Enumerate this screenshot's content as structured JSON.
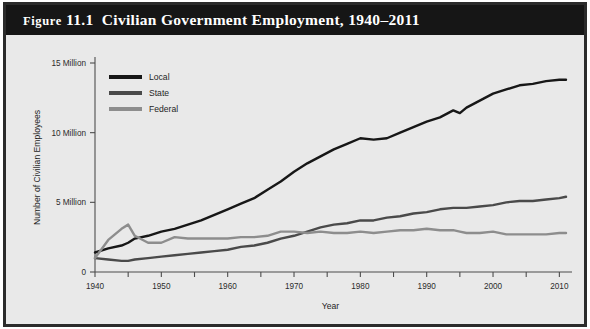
{
  "figure": {
    "label": "Figure",
    "number": "11.1",
    "title": "Civilian Government Employment, 1940–2011",
    "full_title": "Figure 11.1  Civilian Government Employment, 1940–2011"
  },
  "colors": {
    "title_band": "#161616",
    "plot_background": "#e9e9e9",
    "frame": "#2b2b2b",
    "axis": "#4d4d4d",
    "local": "#171717",
    "state": "#4a4a4a",
    "federal": "#8d8d8d"
  },
  "legend": {
    "position": "top-left",
    "items": [
      {
        "label": "Local",
        "color": "#171717",
        "width": 2.6
      },
      {
        "label": "State",
        "color": "#4a4a4a",
        "width": 2.6
      },
      {
        "label": "Federal",
        "color": "#8d8d8d",
        "width": 2.6
      }
    ]
  },
  "chart_data": {
    "type": "line",
    "title": "Civilian Government Employment, 1940–2011",
    "xlabel": "Year",
    "ylabel": "Number of Civilian Employees",
    "xlim": [
      1940,
      2011
    ],
    "ylim": [
      0,
      15
    ],
    "grid": false,
    "units": "millions of employees",
    "legend_position": "top-left",
    "xticks": [
      1940,
      1945,
      1950,
      1955,
      1960,
      1965,
      1970,
      1975,
      1980,
      1985,
      1990,
      1995,
      2000,
      2005,
      2010
    ],
    "xtick_labels": [
      "1940",
      "",
      "1950",
      "",
      "1960",
      "",
      "1970",
      "",
      "1980",
      "",
      "1990",
      "",
      "2000",
      "",
      "2010"
    ],
    "yticks": [
      0,
      5,
      10,
      15
    ],
    "ytick_labels": [
      "0",
      "5 Million",
      "10 Million",
      "15 Million"
    ],
    "x": [
      1940,
      1942,
      1944,
      1945,
      1946,
      1948,
      1950,
      1952,
      1954,
      1956,
      1958,
      1960,
      1962,
      1964,
      1966,
      1968,
      1970,
      1972,
      1974,
      1976,
      1978,
      1980,
      1982,
      1984,
      1986,
      1988,
      1990,
      1992,
      1994,
      1995,
      1996,
      1998,
      2000,
      2002,
      2004,
      2006,
      2008,
      2010,
      2011
    ],
    "series": [
      {
        "name": "Local",
        "color": "#171717",
        "values": [
          1.4,
          1.7,
          1.9,
          2.1,
          2.4,
          2.6,
          2.9,
          3.1,
          3.4,
          3.7,
          4.1,
          4.5,
          4.9,
          5.3,
          5.9,
          6.5,
          7.2,
          7.8,
          8.3,
          8.8,
          9.2,
          9.6,
          9.5,
          9.6,
          10.0,
          10.4,
          10.8,
          11.1,
          11.6,
          11.4,
          11.8,
          12.3,
          12.8,
          13.1,
          13.4,
          13.5,
          13.7,
          13.8,
          13.8
        ]
      },
      {
        "name": "State",
        "color": "#4a4a4a",
        "values": [
          1.0,
          0.9,
          0.8,
          0.8,
          0.9,
          1.0,
          1.1,
          1.2,
          1.3,
          1.4,
          1.5,
          1.6,
          1.8,
          1.9,
          2.1,
          2.4,
          2.6,
          2.9,
          3.2,
          3.4,
          3.5,
          3.7,
          3.7,
          3.9,
          4.0,
          4.2,
          4.3,
          4.5,
          4.6,
          4.6,
          4.6,
          4.7,
          4.8,
          5.0,
          5.1,
          5.1,
          5.2,
          5.3,
          5.4
        ]
      },
      {
        "name": "Federal",
        "color": "#8d8d8d",
        "values": [
          1.0,
          2.3,
          3.1,
          3.4,
          2.6,
          2.1,
          2.1,
          2.5,
          2.4,
          2.4,
          2.4,
          2.4,
          2.5,
          2.5,
          2.6,
          2.9,
          2.9,
          2.8,
          2.9,
          2.8,
          2.8,
          2.9,
          2.8,
          2.9,
          3.0,
          3.0,
          3.1,
          3.0,
          3.0,
          2.9,
          2.8,
          2.8,
          2.9,
          2.7,
          2.7,
          2.7,
          2.7,
          2.8,
          2.8
        ]
      }
    ]
  }
}
